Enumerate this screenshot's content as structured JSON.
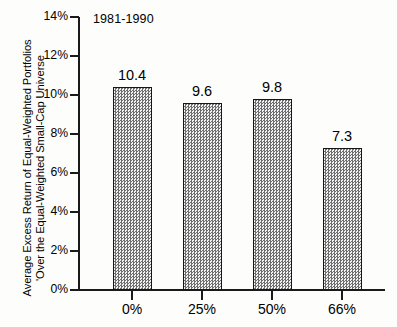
{
  "chart_data": {
    "type": "bar",
    "title": "",
    "annotation": "1981-1990",
    "categories": [
      "0%",
      "25%",
      "50%",
      "66%"
    ],
    "values": [
      10.4,
      9.6,
      9.8,
      7.3
    ],
    "value_labels": [
      "10.4",
      "9.6",
      "9.8",
      "7.3"
    ],
    "xlabel": "",
    "ylabel_line1": "Average Excess Return of Equal-Weighted Portfolios",
    "ylabel_line2": "'Over the Equal-Weighted Small-Cap Universe",
    "ylim": [
      0,
      14
    ],
    "ytick_labels": [
      "0%",
      "2%",
      "4%",
      "6%",
      "8%",
      "10%",
      "12%",
      "14%"
    ],
    "ytick_values": [
      0,
      2,
      4,
      6,
      8,
      10,
      12,
      14
    ],
    "grid": false,
    "legend": false,
    "bar_fill": "#b9b9b9",
    "bar_border": "#161616",
    "axis_color": "#1a1a1a",
    "background": "#fdfdfc"
  }
}
